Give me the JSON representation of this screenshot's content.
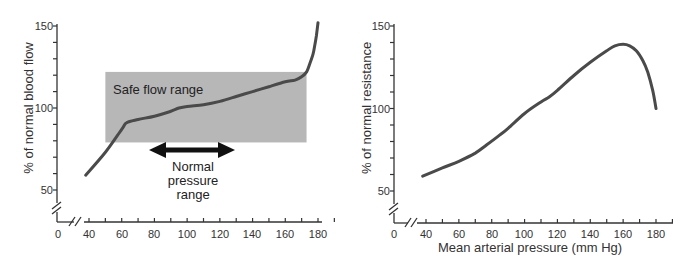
{
  "chart_data": [
    {
      "type": "line",
      "title": "",
      "xlabel": "",
      "ylabel": "% of normal blood flow",
      "xlim": [
        0,
        190
      ],
      "ylim": [
        40,
        150
      ],
      "x_ticks": [
        40,
        60,
        80,
        100,
        120,
        140,
        160,
        180
      ],
      "x_tick_labels": [
        "0",
        "40",
        "60",
        "80",
        "100",
        "120",
        "140",
        "160",
        "180"
      ],
      "y_ticks": [
        50,
        100,
        150
      ],
      "y_tick_labels": [
        "50",
        "100",
        "150"
      ],
      "axis_breaks": true,
      "grid": false,
      "series": [
        {
          "name": "Blood flow",
          "color": "#4a4a4a",
          "x": [
            38,
            50,
            60,
            63,
            70,
            80,
            90,
            95,
            100,
            110,
            120,
            130,
            140,
            150,
            160,
            166,
            170,
            173,
            175,
            177,
            178,
            179,
            180
          ],
          "y": [
            59,
            73,
            87,
            91,
            93,
            95,
            98,
            100,
            101,
            102,
            104,
            107,
            110,
            113,
            116,
            117,
            119,
            122,
            127,
            133,
            138,
            144,
            152
          ]
        }
      ],
      "annotations": [
        {
          "type": "shaded_region",
          "label": "Safe flow range",
          "x_range": [
            50,
            173
          ],
          "y_range": [
            79,
            122
          ],
          "color": "#b3b3b3"
        },
        {
          "type": "double_arrow",
          "label": "Normal pressure range",
          "x_range": [
            75,
            128
          ],
          "y": 75
        }
      ]
    },
    {
      "type": "line",
      "title": "",
      "xlabel": "Mean arterial pressure (mm Hg)",
      "ylabel": "% of normal resistance",
      "xlim": [
        0,
        190
      ],
      "ylim": [
        40,
        150
      ],
      "x_ticks": [
        40,
        60,
        80,
        100,
        120,
        140,
        160,
        180
      ],
      "x_tick_labels": [
        "0",
        "40",
        "60",
        "80",
        "100",
        "120",
        "140",
        "160",
        "180"
      ],
      "y_ticks": [
        50,
        100,
        150
      ],
      "y_tick_labels": [
        "50",
        "100",
        "150"
      ],
      "axis_breaks": true,
      "grid": false,
      "series": [
        {
          "name": "Resistance",
          "color": "#4a4a4a",
          "x": [
            38,
            50,
            60,
            70,
            77,
            85,
            90,
            100,
            110,
            115,
            120,
            130,
            140,
            150,
            155,
            160,
            164,
            168,
            172,
            175,
            178,
            180
          ],
          "y": [
            59,
            64,
            68,
            73,
            78,
            84,
            88,
            97,
            104,
            107,
            111,
            120,
            128,
            135,
            138,
            139,
            138,
            135,
            129,
            122,
            111,
            100
          ]
        }
      ]
    }
  ],
  "left_chart": {
    "y_axis_title": "% of normal blood flow",
    "shaded_label": "Safe flow range",
    "arrow_label_lines": [
      "Normal",
      "pressure",
      "range"
    ],
    "y_tick_labels": [
      "150",
      "100",
      "50"
    ],
    "x_tick_labels": [
      "0",
      "40",
      "60",
      "80",
      "100",
      "120",
      "140",
      "160",
      "180"
    ]
  },
  "right_chart": {
    "y_axis_title": "% of normal resistance",
    "x_axis_title": "Mean arterial pressure (mm Hg)",
    "y_tick_labels": [
      "150",
      "100",
      "50"
    ],
    "x_tick_labels": [
      "0",
      "40",
      "60",
      "80",
      "100",
      "120",
      "140",
      "160",
      "180"
    ]
  },
  "colors": {
    "axis": "#333333",
    "curve": "#4a4a4a",
    "shade": "#b3b3b3",
    "arrow": "#111111"
  }
}
